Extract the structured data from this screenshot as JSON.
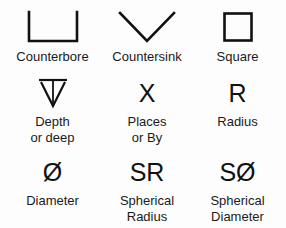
{
  "chart": {
    "background_color": "#fdfdfd",
    "ink_color": "#111111",
    "rows": [
      {
        "cells": [
          {
            "glyph_name": "counterbore-symbol",
            "glyph_kind": "shape",
            "glyph_text": "",
            "label": "Counterbore"
          },
          {
            "glyph_name": "countersink-symbol",
            "glyph_kind": "shape",
            "glyph_text": "",
            "label": "Countersink"
          },
          {
            "glyph_name": "square-symbol",
            "glyph_kind": "shape",
            "glyph_text": "",
            "label": "Square"
          }
        ]
      },
      {
        "cells": [
          {
            "glyph_name": "depth-symbol",
            "glyph_kind": "shape",
            "glyph_text": "",
            "label": "Depth\nor deep"
          },
          {
            "glyph_name": "places-symbol",
            "glyph_kind": "text",
            "glyph_text": "X",
            "label": "Places\nor By"
          },
          {
            "glyph_name": "radius-symbol",
            "glyph_kind": "text",
            "glyph_text": "R",
            "label": "Radius"
          }
        ]
      },
      {
        "cells": [
          {
            "glyph_name": "diameter-symbol",
            "glyph_kind": "text",
            "glyph_text": "Ø",
            "label": "Diameter"
          },
          {
            "glyph_name": "spherical-radius-symbol",
            "glyph_kind": "text",
            "glyph_text": "SR",
            "label": "Spherical\nRadius"
          },
          {
            "glyph_name": "spherical-diameter-symbol",
            "glyph_kind": "text",
            "glyph_text": "SØ",
            "label": "Spherical\nDiameter"
          }
        ]
      }
    ]
  }
}
